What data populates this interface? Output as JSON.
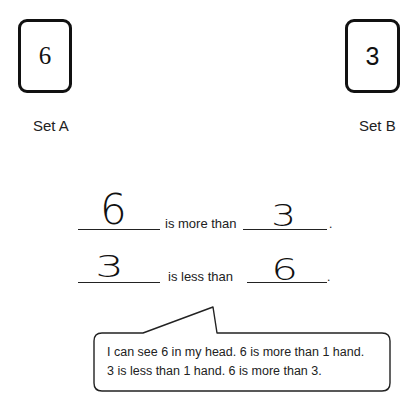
{
  "set_a": {
    "value": "6",
    "label": "Set A"
  },
  "set_b": {
    "value": "3",
    "label": "Set B"
  },
  "sentences": [
    {
      "left_answer": "6",
      "phrase": "is more than",
      "right_answer": "3",
      "end": "."
    },
    {
      "left_answer": "3",
      "phrase": "is less than",
      "right_answer": "6",
      "end": "."
    }
  ],
  "callout": {
    "lines": [
      "I can see 6 in my head.  6 is more than 1 hand.",
      "3 is less than 1 hand.  6 is more than 3."
    ]
  }
}
